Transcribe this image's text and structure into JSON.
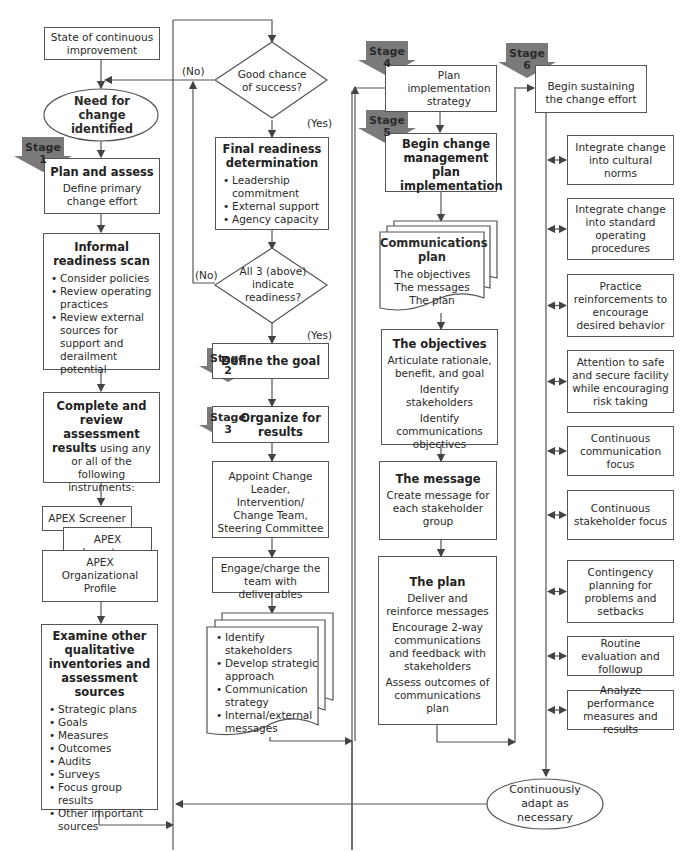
{
  "colors": {
    "stage_badge": "#7a7a7a",
    "line": "#555555",
    "text": "#2a2a2a"
  },
  "stages": [
    "Stage 1",
    "Stage 2",
    "Stage 3",
    "Stage 4",
    "Stage 5",
    "Stage 6"
  ],
  "stage_labels": {
    "s1": {
      "word": "Stage",
      "num": "1"
    },
    "s2": {
      "word": "Stage",
      "num": "2"
    },
    "s3": {
      "word": "Stage",
      "num": "3"
    },
    "s4": {
      "word": "Stage",
      "num": "4"
    },
    "s5": {
      "word": "Stage",
      "num": "5"
    },
    "s6": {
      "word": "Stage",
      "num": "6"
    }
  },
  "col1": {
    "state": "State of continuous improvement",
    "need": "Need for change identified",
    "plan_assess": {
      "title": "Plan and assess",
      "body": "Define primary change effort"
    },
    "informal": {
      "title": "Informal readiness scan",
      "items": [
        "Consider policies",
        "Review operating practices",
        "Review external sources for support and derailment potential"
      ]
    },
    "complete": {
      "title": "Complete and review assessment results",
      "body": " using any or all of the following instruments:"
    },
    "apex": {
      "screener": "APEX Screener",
      "inventory": "APEX Inventory",
      "profile": "APEX Organizational Profile"
    },
    "examine": {
      "title": "Examine other qualitative inventories and assessment sources",
      "items": [
        "Strategic plans",
        "Goals",
        "Measures",
        "Outcomes",
        "Audits",
        "Surveys",
        "Focus group results",
        "Other important sources"
      ]
    }
  },
  "col2": {
    "good_chance": "Good chance of success?",
    "no1": "(No)",
    "yes1": "(Yes)",
    "final": {
      "title": "Final readiness determination",
      "items": [
        "Leadership commitment",
        "External support",
        "Agency capacity"
      ]
    },
    "all3": "All 3 (above) indicate readiness?",
    "no2": "(No)",
    "yes2": "(Yes)",
    "define_goal": "Define the goal",
    "organize": "Organize for results",
    "appoint": "Appoint Change Leader, Intervention/ Change Team, Steering Committee",
    "engage": "Engage/charge the team with deliverables",
    "deliverables": [
      "Identify stakeholders",
      "Develop strategic approach",
      "Communication strategy",
      "Internal/external messages"
    ]
  },
  "col3": {
    "plan_impl": "Plan implementation strategy",
    "begin_change": "Begin change management plan implementation",
    "comm_plan": {
      "title": "Communications plan",
      "lines": [
        "The objectives",
        "The messages",
        "The plan"
      ]
    },
    "objectives": {
      "title": "The objectives",
      "lines": [
        "Articulate rationale, benefit, and goal",
        "Identify stakeholders",
        "Identify communications objectives"
      ]
    },
    "message": {
      "title": "The message",
      "lines": [
        "Create message for each stakeholder group"
      ]
    },
    "plan": {
      "title": "The plan",
      "lines": [
        "Deliver and reinforce messages",
        "Encourage 2-way communications and feedback with stakeholders",
        "Assess outcomes of communications plan"
      ]
    }
  },
  "col4": {
    "begin_sustain": "Begin sustaining the change effort",
    "items": [
      "Integrate change into cultural norms",
      "Integrate change into standard operating procedures",
      "Practice reinforcements to encourage desired behavior",
      "Attention to safe and secure facility while encouraging risk taking",
      "Continuous communication focus",
      "Continuous stakeholder focus",
      "Contingency planning for problems and setbacks",
      "Routine evaluation and followup",
      "Analyze performance measures and results"
    ],
    "adapt": "Continuously adapt as necessary"
  }
}
